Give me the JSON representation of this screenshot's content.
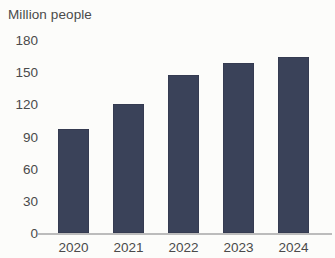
{
  "chart_data": {
    "type": "bar",
    "title": "",
    "xlabel": "",
    "ylabel": "Million people",
    "categories": [
      "2020",
      "2021",
      "2022",
      "2023",
      "2024"
    ],
    "values": [
      97,
      120,
      147,
      159,
      164
    ],
    "ylim": [
      0,
      180
    ],
    "yticks": [
      0,
      30,
      60,
      90,
      120,
      150,
      180
    ],
    "ytick_labels": [
      "0",
      "30",
      "60",
      "90",
      "120",
      "150",
      "180"
    ],
    "grid": false,
    "legend": false,
    "bar_color": "#3a4259",
    "axis_color": "#bcbcbc",
    "text_color": "#4a4a4a",
    "background_color": "#fcfcfa",
    "series": [
      {
        "name": "Million people",
        "values": [
          97,
          120,
          147,
          159,
          164
        ]
      }
    ]
  }
}
